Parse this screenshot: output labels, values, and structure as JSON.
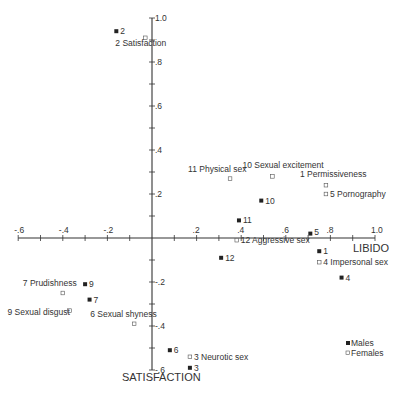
{
  "chart_data": {
    "type": "scatter",
    "title": "",
    "xlabel": "LIBIDO",
    "ylabel": "SATISFACTION",
    "xlim": [
      -0.6,
      1.0
    ],
    "ylim": [
      -0.6,
      1.0
    ],
    "grid": false,
    "axes_cross_at_origin": true,
    "x_tick_labels": [
      "-.6",
      "-.4",
      "-.2",
      ".2",
      ".4",
      ".6",
      ".8",
      "1.0"
    ],
    "x_ticks": [
      -0.6,
      -0.4,
      -0.2,
      0.2,
      0.4,
      0.6,
      0.8,
      1.0
    ],
    "y_tick_labels": [
      "1.0",
      ".8",
      ".6",
      ".4",
      ".2",
      "-.2",
      "-.4",
      "-.6"
    ],
    "y_ticks": [
      1.0,
      0.8,
      0.6,
      0.4,
      0.2,
      -0.2,
      -0.4,
      -0.6
    ],
    "legend": {
      "position": "lower right",
      "entries": [
        {
          "label": "Males",
          "marker": "filled-square"
        },
        {
          "label": "Females",
          "marker": "open-square"
        }
      ]
    },
    "series": [
      {
        "name": "Males",
        "marker": "filled-square",
        "points": [
          {
            "id": "1",
            "x": 0.75,
            "y": -0.06
          },
          {
            "id": "2",
            "x": -0.16,
            "y": 0.94
          },
          {
            "id": "3",
            "x": 0.17,
            "y": -0.59
          },
          {
            "id": "4",
            "x": 0.85,
            "y": -0.18
          },
          {
            "id": "5",
            "x": 0.71,
            "y": 0.02
          },
          {
            "id": "6",
            "x": 0.08,
            "y": -0.51
          },
          {
            "id": "7",
            "x": -0.28,
            "y": -0.28
          },
          {
            "id": "9",
            "x": -0.3,
            "y": -0.21
          },
          {
            "id": "10",
            "x": 0.49,
            "y": 0.17
          },
          {
            "id": "11",
            "x": 0.39,
            "y": 0.08
          },
          {
            "id": "12",
            "x": 0.31,
            "y": -0.09
          }
        ]
      },
      {
        "name": "Females",
        "marker": "open-square",
        "points": [
          {
            "id": "1",
            "label": "1 Permissiveness",
            "x": 0.78,
            "y": 0.24
          },
          {
            "id": "2",
            "label": "2 Satisfaction",
            "x": -0.03,
            "y": 0.91
          },
          {
            "id": "3",
            "label": "3 Neurotic sex",
            "x": 0.17,
            "y": -0.54
          },
          {
            "id": "4",
            "label": "4 Impersonal sex",
            "x": 0.75,
            "y": -0.11
          },
          {
            "id": "5",
            "label": "5 Pornography",
            "x": 0.78,
            "y": 0.2
          },
          {
            "id": "6",
            "label": "6 Sexual shyness",
            "x": -0.08,
            "y": -0.39
          },
          {
            "id": "7",
            "label": "7 Prudishness",
            "x": -0.4,
            "y": -0.25
          },
          {
            "id": "9",
            "label": "9 Sexual disgust",
            "x": -0.37,
            "y": -0.33
          },
          {
            "id": "10",
            "label": "10 Sexual excitement",
            "x": 0.54,
            "y": 0.28
          },
          {
            "id": "11",
            "label": "11 Physical sex",
            "x": 0.35,
            "y": 0.27
          },
          {
            "id": "12",
            "label": "12 Aggressive sex",
            "x": 0.38,
            "y": -0.01
          }
        ]
      }
    ]
  },
  "layout": {
    "origin_px": [
      152,
      238
    ],
    "px_per_unit_x": 223,
    "px_per_unit_y": 220,
    "axis_color": "#333333",
    "marker_color": "#222222"
  },
  "label_positions": {
    "male_labels": {
      "1": {
        "dx": 4,
        "dy": 3
      },
      "2": {
        "dx": 4,
        "dy": 3
      },
      "3": {
        "dx": 4,
        "dy": 3
      },
      "4": {
        "dx": 4,
        "dy": 3
      },
      "5": {
        "dx": 4,
        "dy": 1
      },
      "6": {
        "dx": 4,
        "dy": 3
      },
      "7": {
        "dx": 4,
        "dy": 3
      },
      "9": {
        "dx": 4,
        "dy": 3
      },
      "10": {
        "dx": 4,
        "dy": 3
      },
      "11": {
        "dx": 4,
        "dy": 3
      },
      "12": {
        "dx": 4,
        "dy": 3
      }
    },
    "female_labels": {
      "1": {
        "dx": -26,
        "dy": -8
      },
      "2": {
        "dx": -30,
        "dy": 8
      },
      "3": {
        "dx": 4,
        "dy": 3
      },
      "4": {
        "dx": 4,
        "dy": 3
      },
      "5": {
        "dx": 4,
        "dy": 3
      },
      "6": {
        "dx": -44,
        "dy": -7
      },
      "7": {
        "dx": -40,
        "dy": -7
      },
      "9": {
        "dx": -62,
        "dy": 4
      },
      "10": {
        "dx": -30,
        "dy": -8
      },
      "11": {
        "dx": -42,
        "dy": -7
      },
      "12": {
        "dx": 4,
        "dy": 3
      }
    }
  }
}
